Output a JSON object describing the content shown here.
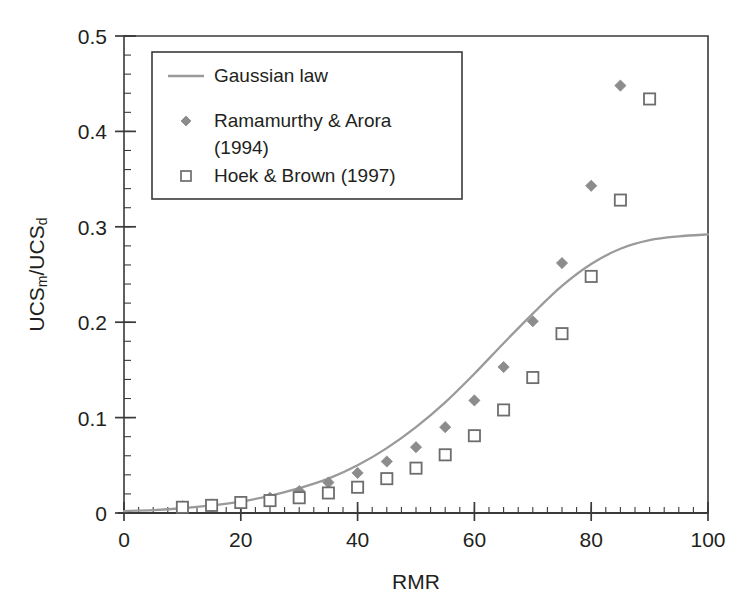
{
  "chart_data": {
    "type": "scatter",
    "title": "",
    "xlabel": "RMR",
    "ylabel": "UCS_m/UCS_d",
    "ylabel_parts": {
      "base1": "UCS",
      "sub1": "m",
      "slash": "/",
      "base2": "UCS",
      "sub2": "d"
    },
    "xlim": [
      0,
      100
    ],
    "ylim": [
      0,
      0.5
    ],
    "xticks": [
      0,
      20,
      40,
      60,
      80,
      100
    ],
    "yticks": [
      0,
      0.1,
      0.2,
      0.3,
      0.4,
      0.5
    ],
    "xtick_labels": [
      "0",
      "20",
      "40",
      "60",
      "80",
      "100"
    ],
    "ytick_labels": [
      "0",
      "0.1",
      "0.2",
      "0.3",
      "0.4",
      "0.5"
    ],
    "x_minor_step": 2.5,
    "y_minor_step": 0.02,
    "grid": false,
    "legend_position": "top-left",
    "series": [
      {
        "name": "Gaussian law",
        "type": "line",
        "marker": "line",
        "color": "#9a9a9a",
        "x": [
          0,
          5,
          10,
          15,
          20,
          25,
          30,
          35,
          40,
          45,
          50,
          55,
          60,
          65,
          70,
          75,
          80,
          85,
          90,
          95,
          100
        ],
        "values": [
          0.002,
          0.003,
          0.005,
          0.008,
          0.012,
          0.018,
          0.026,
          0.036,
          0.05,
          0.068,
          0.09,
          0.116,
          0.146,
          0.178,
          0.209,
          0.238,
          0.261,
          0.277,
          0.286,
          0.29,
          0.292
        ]
      },
      {
        "name": "Ramamurthy & Arora (1994)",
        "type": "scatter",
        "marker": "filled-diamond",
        "color": "#8c8c8c",
        "x": [
          10,
          15,
          20,
          25,
          30,
          35,
          40,
          45,
          50,
          55,
          60,
          65,
          70,
          75,
          80,
          85
        ],
        "values": [
          0.007,
          0.009,
          0.012,
          0.016,
          0.023,
          0.032,
          0.042,
          0.054,
          0.069,
          0.09,
          0.118,
          0.153,
          0.201,
          0.262,
          0.343,
          0.448
        ]
      },
      {
        "name": "Hoek & Brown (1997)",
        "type": "scatter",
        "marker": "open-square",
        "color": "#6d6d6d",
        "x": [
          10,
          15,
          20,
          25,
          30,
          35,
          40,
          45,
          50,
          55,
          60,
          65,
          70,
          75,
          80,
          85,
          90
        ],
        "values": [
          0.006,
          0.008,
          0.011,
          0.013,
          0.016,
          0.021,
          0.027,
          0.036,
          0.047,
          0.061,
          0.081,
          0.108,
          0.142,
          0.188,
          0.248,
          0.328,
          0.434
        ]
      }
    ],
    "legend_entries": [
      {
        "label": "Gaussian law",
        "marker": "line",
        "color": "#9a9a9a"
      },
      {
        "label": "Ramamurthy & Arora",
        "label2": "(1994)",
        "marker": "filled-diamond",
        "color": "#8c8c8c"
      },
      {
        "label": "Hoek & Brown (1997)",
        "marker": "open-square",
        "color": "#6d6d6d"
      }
    ]
  },
  "colors": {
    "axis": "#3a3a3a",
    "text": "#231f20",
    "curve": "#9a9a9a",
    "diamond": "#8c8c8c",
    "square": "#6d6d6d",
    "legend_border": "#3a3a3a",
    "background": "#ffffff"
  }
}
